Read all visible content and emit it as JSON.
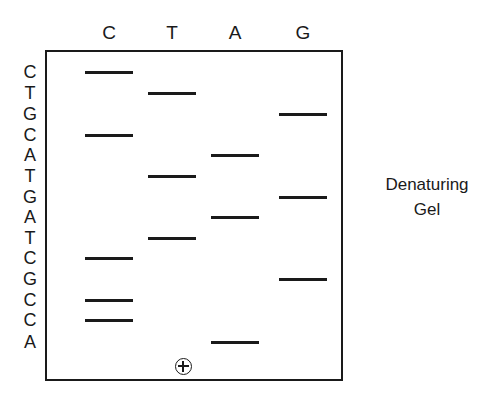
{
  "side_caption": {
    "line1": "Denaturing",
    "line2": "Gel"
  },
  "anode": {
    "symbol": "⊕",
    "label": "anode-plus"
  },
  "lanes": [
    {
      "id": "lane-c",
      "label": "C",
      "center_x": 109
    },
    {
      "id": "lane-t",
      "label": "T",
      "center_x": 172
    },
    {
      "id": "lane-a",
      "label": "A",
      "center_x": 235
    },
    {
      "id": "lane-g",
      "label": "G",
      "center_x": 303
    }
  ],
  "sequence": {
    "read_direction": "top-to-bottom",
    "letters": [
      "C",
      "T",
      "G",
      "C",
      "A",
      "T",
      "G",
      "A",
      "T",
      "C",
      "G",
      "C",
      "C",
      "A"
    ],
    "string": "CTGCATGATCGCCA",
    "length": 14
  },
  "chart_data": {
    "type": "scatter",
    "xlabel": "",
    "ylabel": "",
    "grid": false,
    "legend": "none",
    "axis_ranges": {
      "x": [
        45,
        343
      ],
      "y": [
        50,
        381
      ]
    },
    "lane_order": [
      "C",
      "T",
      "A",
      "G"
    ],
    "lane_centers_px": {
      "C": 109,
      "T": 172,
      "A": 235,
      "G": 303
    },
    "band_width_px": 48,
    "gel_box_px": {
      "left": 45,
      "top": 50,
      "width": 298,
      "height": 331
    },
    "anode_position_px": {
      "x": 183,
      "y": 366
    },
    "bands": [
      {
        "index": 1,
        "base": "C",
        "lane": "C",
        "y": 72,
        "label": "C"
      },
      {
        "index": 2,
        "base": "T",
        "lane": "T",
        "y": 93,
        "label": "T"
      },
      {
        "index": 3,
        "base": "G",
        "lane": "G",
        "y": 114,
        "label": "G"
      },
      {
        "index": 4,
        "base": "C",
        "lane": "C",
        "y": 135,
        "label": "C"
      },
      {
        "index": 5,
        "base": "A",
        "lane": "A",
        "y": 155,
        "label": "A"
      },
      {
        "index": 6,
        "base": "T",
        "lane": "T",
        "y": 176,
        "label": "T"
      },
      {
        "index": 7,
        "base": "G",
        "lane": "G",
        "y": 197,
        "label": "G"
      },
      {
        "index": 8,
        "base": "A",
        "lane": "A",
        "y": 217,
        "label": "A"
      },
      {
        "index": 9,
        "base": "T",
        "lane": "T",
        "y": 238,
        "label": "T"
      },
      {
        "index": 10,
        "base": "C",
        "lane": "C",
        "y": 258,
        "label": "C"
      },
      {
        "index": 11,
        "base": "G",
        "lane": "G",
        "y": 279,
        "label": "G"
      },
      {
        "index": 12,
        "base": "C",
        "lane": "C",
        "y": 300,
        "label": "C"
      },
      {
        "index": 13,
        "base": "C",
        "lane": "C",
        "y": 320,
        "label": "C"
      },
      {
        "index": 14,
        "base": "A",
        "lane": "A",
        "y": 342,
        "label": "A"
      }
    ],
    "annotations": [
      {
        "text": "Denaturing",
        "x": 427,
        "y": 185
      },
      {
        "text": "Gel",
        "x": 427,
        "y": 210
      },
      {
        "text": "⊕",
        "x": 183,
        "y": 366
      }
    ]
  },
  "colors": {
    "ink": "#1a1a1a",
    "background": "#ffffff"
  }
}
